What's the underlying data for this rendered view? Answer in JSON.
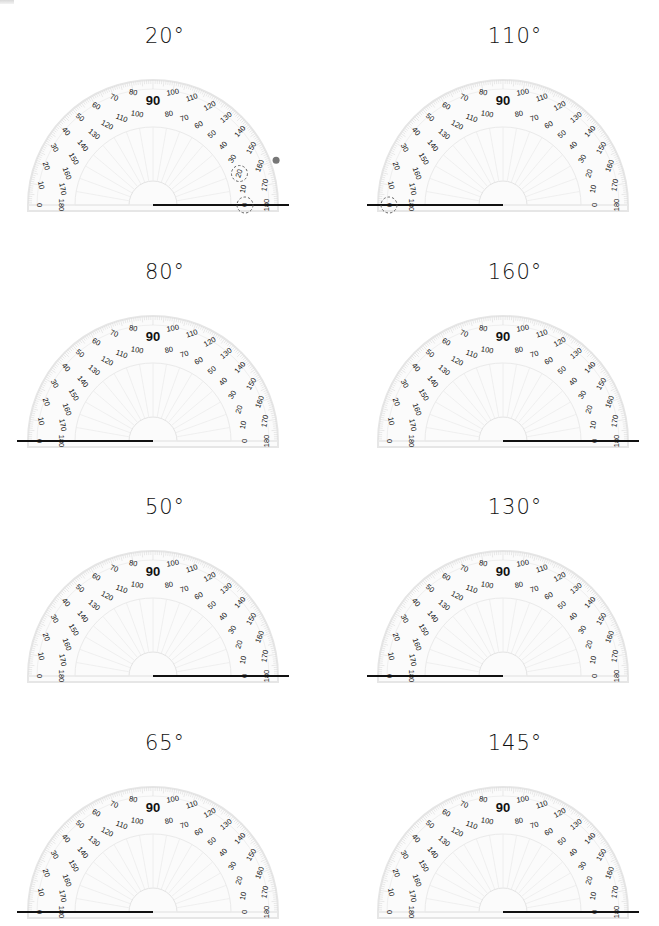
{
  "worksheet": {
    "problems": [
      {
        "id": 1,
        "label": "20°",
        "angle": 20,
        "column": "left",
        "row": 0,
        "ray": "right",
        "hints": {
          "dot_at_angle": 20,
          "circled_outer": "20",
          "circled_vertex": true
        }
      },
      {
        "id": 2,
        "label": "110°",
        "angle": 110,
        "column": "right",
        "row": 0,
        "ray": "left",
        "hints": {
          "circled_vertex_left": true
        }
      },
      {
        "id": 3,
        "label": "80°",
        "angle": 80,
        "column": "left",
        "row": 1,
        "ray": "left"
      },
      {
        "id": 4,
        "label": "160°",
        "angle": 160,
        "column": "right",
        "row": 1,
        "ray": "right"
      },
      {
        "id": 5,
        "label": "50°",
        "angle": 50,
        "column": "left",
        "row": 2,
        "ray": "right"
      },
      {
        "id": 6,
        "label": "130°",
        "angle": 130,
        "column": "right",
        "row": 2,
        "ray": "left"
      },
      {
        "id": 7,
        "label": "65°",
        "angle": 65,
        "column": "left",
        "row": 3,
        "ray": "left"
      },
      {
        "id": 8,
        "label": "145°",
        "angle": 145,
        "column": "right",
        "row": 3,
        "ray": "right"
      }
    ],
    "protractor": {
      "outer_scale": [
        "0",
        "10",
        "20",
        "30",
        "40",
        "50",
        "60",
        "70",
        "80",
        "90",
        "100",
        "110",
        "120",
        "130",
        "140",
        "150",
        "160",
        "170",
        "180"
      ],
      "inner_scale": [
        "180",
        "170",
        "160",
        "150",
        "140",
        "130",
        "120",
        "110",
        "100",
        "90",
        "80",
        "70",
        "60",
        "50",
        "40",
        "30",
        "20",
        "10",
        "0"
      ],
      "center_label": "90"
    },
    "colors": {
      "ink": "#111111",
      "protractor_line": "#e6e6e6",
      "protractor_tick": "#dcdcdc",
      "hint_dot": "#777777",
      "hint_circle": "#555555"
    }
  }
}
